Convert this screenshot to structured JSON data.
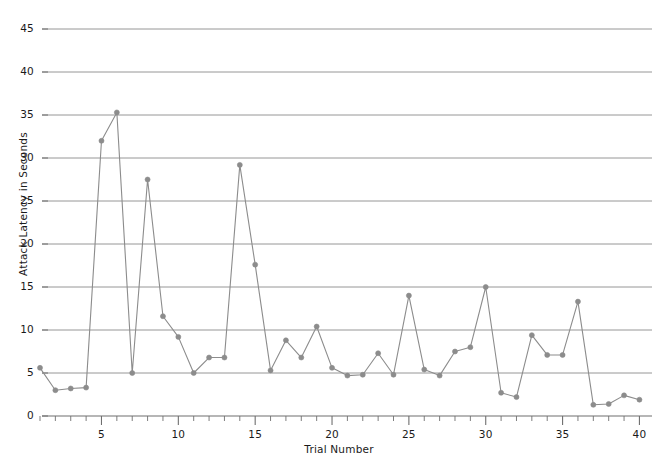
{
  "chart_data": {
    "type": "line",
    "title": "",
    "xlabel": "Trial Number",
    "ylabel": "Attack Latency in Seconds",
    "xlim": [
      0,
      40.6
    ],
    "ylim": [
      0,
      50
    ],
    "grid": "horizontal",
    "legend": "none",
    "line_color": "#8c8c8c",
    "marker_color": "#8c8c8c",
    "grid_color": "#8a8a8a",
    "axis_color": "#6f6f6f",
    "text_color": "#1a1a1a",
    "y_ticks": [
      0,
      5,
      10,
      15,
      20,
      25,
      30,
      35,
      40,
      45,
      50
    ],
    "y_tick_labels": [
      "0",
      "5",
      "10",
      "15",
      "20",
      "25",
      "30",
      "35",
      "40",
      "45",
      "50"
    ],
    "x_ticks": [
      5,
      10,
      15,
      20,
      25,
      30,
      35,
      40
    ],
    "x_tick_labels": [
      "5",
      "10",
      "15",
      "20",
      "25",
      "30",
      "35",
      "40"
    ],
    "x_minor_ticks": [
      1,
      2,
      3,
      4,
      6,
      7,
      8,
      9,
      11,
      12,
      13,
      14,
      16,
      17,
      18,
      19,
      21,
      22,
      23,
      24,
      26,
      27,
      28,
      29,
      31,
      32,
      33,
      34,
      36,
      37,
      38,
      39
    ],
    "x": [
      1,
      2,
      3,
      4,
      5,
      6,
      7,
      8,
      9,
      10,
      11,
      12,
      13,
      14,
      15,
      16,
      17,
      18,
      19,
      20,
      21,
      22,
      23,
      24,
      25,
      26,
      27,
      28,
      29,
      30,
      31,
      32,
      33,
      34,
      35,
      36,
      37,
      38,
      39,
      40
    ],
    "values": [
      5.6,
      3.0,
      3.2,
      3.3,
      32.0,
      35.3,
      5.0,
      27.5,
      11.6,
      9.2,
      5.0,
      6.8,
      6.8,
      29.2,
      17.6,
      5.3,
      8.8,
      6.8,
      10.4,
      5.6,
      4.7,
      4.8,
      7.3,
      4.8,
      14.0,
      5.4,
      4.7,
      7.5,
      8.0,
      15.0,
      2.7,
      2.2,
      9.4,
      7.1,
      7.1,
      13.3,
      1.3,
      1.4,
      2.4,
      1.9
    ],
    "series_name": "Attack Latency"
  }
}
